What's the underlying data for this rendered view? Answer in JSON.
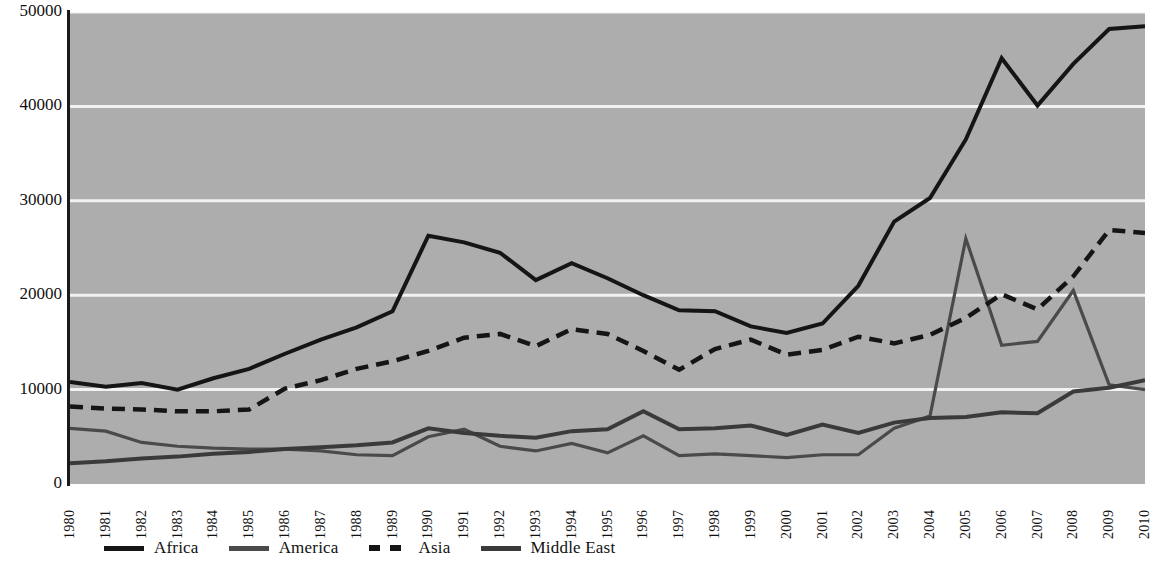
{
  "chart_data": {
    "type": "line",
    "title": "",
    "subtitle": "",
    "xlabel": "",
    "ylabel": "",
    "categories": [
      "1980",
      "1981",
      "1982",
      "1983",
      "1984",
      "1985",
      "1986",
      "1987",
      "1988",
      "1989",
      "1990",
      "1991",
      "1992",
      "1993",
      "1994",
      "1995",
      "1996",
      "1997",
      "1998",
      "1999",
      "2000",
      "2001",
      "2002",
      "2003",
      "2004",
      "2005",
      "2006",
      "2007",
      "2008",
      "2009",
      "2010"
    ],
    "ylim": [
      0,
      50000
    ],
    "xlim": [
      "1980",
      "2010"
    ],
    "yticks": [
      "0",
      "10000",
      "20000",
      "30000",
      "40000",
      "50000"
    ],
    "ytick_values": [
      0,
      10000,
      20000,
      30000,
      40000,
      50000
    ],
    "grid": "horizontal",
    "legend_position": "bottom",
    "plot_background": "#adadad",
    "series": [
      {
        "name": "Africa",
        "color": "#151515",
        "style": "solid",
        "width": 4.0,
        "values": [
          10800,
          10300,
          10700,
          10000,
          11200,
          12200,
          13800,
          15300,
          16600,
          18300,
          26300,
          25600,
          24500,
          21600,
          23400,
          21800,
          20000,
          18400,
          18300,
          16700,
          16000,
          17000,
          21000,
          27800,
          30300,
          36500,
          45100,
          40100,
          44500,
          48200,
          48500
        ]
      },
      {
        "name": "America",
        "color": "#4a4a4a",
        "style": "solid",
        "width": 3.2,
        "values": [
          5900,
          5600,
          4400,
          4000,
          3800,
          3700,
          3700,
          3500,
          3100,
          3000,
          5000,
          5800,
          4000,
          3500,
          4300,
          3300,
          5100,
          3000,
          3200,
          3000,
          2800,
          3100,
          3100,
          5900,
          7200,
          26000,
          14700,
          15100,
          20500,
          10500,
          10000
        ]
      },
      {
        "name": "Asia",
        "color": "#151515",
        "style": "dashed",
        "width": 4.5,
        "values": [
          8200,
          8000,
          7900,
          7700,
          7700,
          7900,
          10100,
          11000,
          12200,
          13000,
          14100,
          15500,
          15900,
          14600,
          16400,
          15900,
          14100,
          12100,
          14300,
          15300,
          13700,
          14200,
          15600,
          14900,
          15800,
          17600,
          20100,
          18500,
          22000,
          26900,
          26600
        ]
      },
      {
        "name": "Middle East",
        "color": "#3a3a3a",
        "style": "solid",
        "width": 4.0,
        "values": [
          2200,
          2400,
          2700,
          2900,
          3200,
          3400,
          3700,
          3900,
          4100,
          4400,
          5900,
          5400,
          5100,
          4900,
          5600,
          5800,
          7700,
          5800,
          5900,
          6200,
          5200,
          6300,
          5400,
          6500,
          7000,
          7100,
          7600,
          7500,
          9800,
          10200,
          11000
        ]
      }
    ]
  },
  "legend": {
    "items": [
      {
        "label": "Africa",
        "swatch": "solid-black"
      },
      {
        "label": "America",
        "swatch": "solid-gray"
      },
      {
        "label": "Asia",
        "swatch": "dashed-black"
      },
      {
        "label": "Middle East",
        "swatch": "solid-darkgray"
      }
    ]
  },
  "axes": {
    "y_labels": [
      "50000",
      "40000",
      "30000",
      "20000",
      "10000",
      "0"
    ],
    "x_labels": [
      "1980",
      "1981",
      "1982",
      "1983",
      "1984",
      "1985",
      "1986",
      "1987",
      "1988",
      "1989",
      "1990",
      "1991",
      "1992",
      "1993",
      "1994",
      "1995",
      "1996",
      "1997",
      "1998",
      "1999",
      "2000",
      "2001",
      "2002",
      "2003",
      "2004",
      "2005",
      "2006",
      "2007",
      "2008",
      "2009",
      "2010"
    ]
  }
}
